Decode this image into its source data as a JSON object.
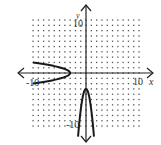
{
  "chart_data": {
    "type": "line",
    "title": "",
    "xlabel": "x",
    "ylabel": "y",
    "xlim": [
      -10,
      10
    ],
    "ylim": [
      -10,
      10
    ],
    "grid": "dotted",
    "tick_labels": {
      "x_left": "-10",
      "x_right": "10",
      "y_top": "10",
      "y_bottom": "-10"
    },
    "series": [
      {
        "name": "left-opening parabola",
        "equation": "x = -3 - 1.75y^2",
        "vertex": [
          -3,
          0
        ],
        "points": [
          [
            -10,
            2
          ],
          [
            -7.75,
            1.5
          ],
          [
            -4.75,
            1
          ],
          [
            -3,
            0
          ],
          [
            -4.75,
            -1
          ],
          [
            -7.75,
            -1.5
          ],
          [
            -10,
            -2
          ]
        ]
      },
      {
        "name": "downward parabola",
        "equation": "y = -3 - 4x^2",
        "vertex": [
          0,
          -3
        ],
        "points": [
          [
            -1.5,
            -12
          ],
          [
            -1,
            -7
          ],
          [
            -0.5,
            -4
          ],
          [
            0,
            -3
          ],
          [
            0.5,
            -4
          ],
          [
            1,
            -7
          ],
          [
            1.5,
            -12
          ]
        ]
      }
    ]
  },
  "labels": {
    "x_axis": "x",
    "y_axis": "y",
    "x_min": "-10",
    "x_max": "10",
    "y_max": "10",
    "y_min": "-10"
  },
  "colors": {
    "axis": "#222222",
    "curve": "#1a1a1a",
    "grid_dot": "#555555"
  }
}
